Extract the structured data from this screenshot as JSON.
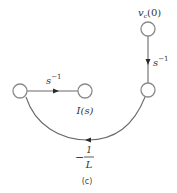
{
  "diagram": {
    "type": "signal-flow-graph",
    "caption": "(c)",
    "nodes": [
      {
        "id": "vc0",
        "label": "v",
        "label_sub": "c",
        "label_arg": "(0)"
      },
      {
        "id": "right",
        "label": ""
      },
      {
        "id": "left",
        "label": ""
      },
      {
        "id": "Is",
        "label": "I(s)"
      }
    ],
    "edges": [
      {
        "from": "vc0",
        "to": "right",
        "gain_base": "s",
        "gain_exp": "−1"
      },
      {
        "from": "left",
        "to": "Is",
        "gain_base": "s",
        "gain_exp": "−1"
      },
      {
        "from": "right",
        "to": "left",
        "gain_sign": "−",
        "gain_num": "1",
        "gain_den": "L"
      }
    ]
  }
}
